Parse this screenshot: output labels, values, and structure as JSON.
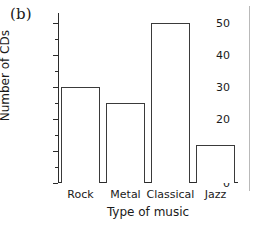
{
  "panel": {
    "label": "(b)"
  },
  "chart_data": {
    "type": "bar",
    "title": "",
    "subtitle": "",
    "xlabel": "Type of music",
    "ylabel": "Number of CDs",
    "categories": [
      "Rock",
      "Metal",
      "Classical",
      "Jazz"
    ],
    "values": [
      30,
      25,
      50,
      12
    ],
    "ylim": [
      0,
      53
    ],
    "y_major_ticks": [
      0,
      10,
      20,
      30,
      40,
      50
    ],
    "y_minor_ticks": [
      5,
      15,
      25,
      35,
      45
    ],
    "y_tick_labels": [
      "0",
      "10",
      "20",
      "30",
      "40",
      "50"
    ],
    "grid": false,
    "legend": null,
    "bar_style": "open-outline",
    "colors": {
      "bar_outline": "#3a3a3a",
      "bar_fill": "#ffffff",
      "axis": "#2b2b2b",
      "text": "#1a1a1a",
      "background": "#ffffff"
    }
  }
}
